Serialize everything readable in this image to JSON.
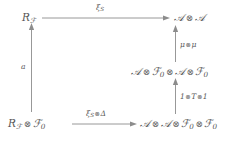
{
  "diagram": {
    "type": "commutative-diagram",
    "title": "",
    "nodes": [
      {
        "id": "top-left",
        "label_plain": "R_F",
        "x": 22,
        "y": 12,
        "parts": [
          {
            "t": "R",
            "style": "italic"
          },
          {
            "t": "F",
            "style": "cal-sub"
          }
        ]
      },
      {
        "id": "top-right",
        "label_plain": "A ⊗ A",
        "x": 172,
        "y": 12
      },
      {
        "id": "middle-right",
        "label_plain": "A ⊗ F_0 ⊗ A ⊗ F_0",
        "x": 133,
        "y": 66
      },
      {
        "id": "bottom-left",
        "label_plain": "R_F ⊗ F_0",
        "x": 8,
        "y": 118
      },
      {
        "id": "bottom-right",
        "label_plain": "A ⊗ A ⊗ F_0 ⊗ F_0",
        "x": 139,
        "y": 118
      }
    ],
    "arrows": [
      {
        "id": "top-horizontal",
        "from": "top-left",
        "to": "top-right",
        "label_plain": "ξ_S",
        "direction": "right"
      },
      {
        "id": "left-vertical",
        "from": "bottom-left",
        "to": "top-left",
        "label_plain": "a",
        "direction": "up"
      },
      {
        "id": "bottom-horizontal",
        "from": "bottom-left",
        "to": "bottom-right",
        "label_plain": "ξ_S⊗Δ",
        "direction": "right"
      },
      {
        "id": "right-lower",
        "from": "bottom-right",
        "to": "middle-right",
        "label_plain": "1⊗T⊗1",
        "direction": "up"
      },
      {
        "id": "right-upper",
        "from": "middle-right",
        "to": "top-right",
        "label_plain": "μ⊗μ",
        "direction": "up"
      }
    ],
    "labels": {
      "node_top_left_R": "R",
      "node_top_left_sub": "ℱ",
      "node_top_right_A1": "𝒜",
      "node_top_right_A2": "𝒜",
      "node_middle_right_A1": "𝒜",
      "node_middle_right_F1": "ℱ",
      "node_middle_right_F1_sub": "0",
      "node_middle_right_A2": "𝒜",
      "node_middle_right_F2": "ℱ",
      "node_middle_right_F2_sub": "0",
      "node_bottom_left_R": "R",
      "node_bottom_left_R_sub": "ℱ",
      "node_bottom_left_F": "ℱ",
      "node_bottom_left_F_sub": "0",
      "node_bottom_right_A1": "𝒜",
      "node_bottom_right_A2": "𝒜",
      "node_bottom_right_F1": "ℱ",
      "node_bottom_right_F1_sub": "0",
      "node_bottom_right_F2": "ℱ",
      "node_bottom_right_F2_sub": "0",
      "arrow_top_xi": "ξ",
      "arrow_top_xi_sub": "S",
      "arrow_left_a": "a",
      "arrow_bottom_xi": "ξ",
      "arrow_bottom_xi_sub": "S",
      "arrow_bottom_delta": "Δ",
      "arrow_right_lower_one_a": "1",
      "arrow_right_lower_T": "T",
      "arrow_right_lower_one_b": "1",
      "arrow_right_upper_mu_a": "μ",
      "arrow_right_upper_mu_b": "μ",
      "tensor": "⊗"
    },
    "colors": {
      "text": "#555555",
      "arrow": "#8c8c8c",
      "background": "#ffffff"
    }
  }
}
